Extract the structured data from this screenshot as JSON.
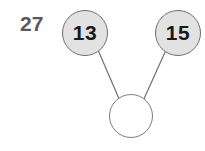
{
  "diagram": {
    "type": "number-bond",
    "title_label": "27",
    "nodes": [
      {
        "id": "left",
        "value": "13",
        "filled": true,
        "cx": 85,
        "cy": 33
      },
      {
        "id": "right",
        "value": "15",
        "filled": true,
        "cx": 178,
        "cy": 33
      },
      {
        "id": "sum",
        "value": "",
        "filled": false,
        "cx": 131,
        "cy": 116
      }
    ],
    "edges": [
      {
        "from": "left",
        "to": "sum",
        "x1": 98,
        "y1": 50,
        "x2": 120,
        "y2": 101
      },
      {
        "from": "right",
        "to": "sum",
        "x1": 166,
        "y1": 50,
        "x2": 143,
        "y2": 101
      }
    ],
    "colors": {
      "background": "#ffffff",
      "node_fill": "#e2e2e2",
      "node_stroke": "#6f6f6f",
      "empty_node_fill": "#ffffff",
      "empty_node_stroke": "#7d7d7d",
      "edge_stroke": "#707070",
      "digit_color": "#1a1a1a",
      "label_color": "#595959"
    }
  }
}
